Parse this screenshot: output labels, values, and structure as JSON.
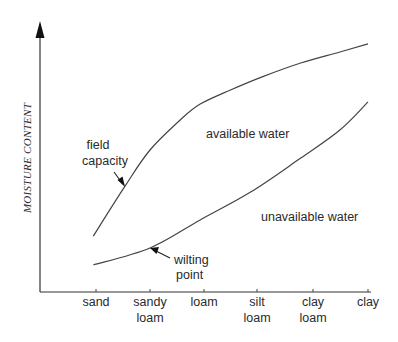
{
  "chart_data": {
    "type": "line",
    "title": "",
    "xlabel": "",
    "ylabel": "MOISTURE CONTENT",
    "categories": [
      [
        "sand"
      ],
      [
        "sandy",
        "loam"
      ],
      [
        "loam"
      ],
      [
        "silt",
        "loam"
      ],
      [
        "clay",
        "loam"
      ],
      [
        "clay"
      ]
    ],
    "xlim": [
      -0.05,
      5.0
    ],
    "ylim": [
      0,
      100
    ],
    "grid": false,
    "series": [
      {
        "name": "field capacity",
        "x": [
          -0.05,
          0.54,
          1.0,
          1.56,
          1.93,
          2.5,
          3.08,
          3.78,
          4.49,
          5.0
        ],
        "values": [
          20.7,
          39.3,
          52.6,
          63.7,
          69.6,
          74.8,
          79.6,
          84.8,
          88.9,
          91.9
        ]
      },
      {
        "name": "wilting point",
        "x": [
          -0.05,
          1.0,
          1.93,
          2.88,
          3.78,
          4.49,
          5.0
        ],
        "values": [
          10.0,
          16.3,
          26.7,
          37.0,
          49.6,
          60.0,
          70.4
        ]
      }
    ],
    "annotations": [
      {
        "id": "field_capacity",
        "lines": [
          "field",
          "capacity"
        ],
        "points_to": "field capacity"
      },
      {
        "id": "wilting_point",
        "lines": [
          "wilting",
          "point"
        ],
        "points_to": "wilting point"
      },
      {
        "id": "available_water",
        "lines": [
          "available water"
        ]
      },
      {
        "id": "unavailable_water",
        "lines": [
          "unavailable water"
        ]
      }
    ]
  }
}
